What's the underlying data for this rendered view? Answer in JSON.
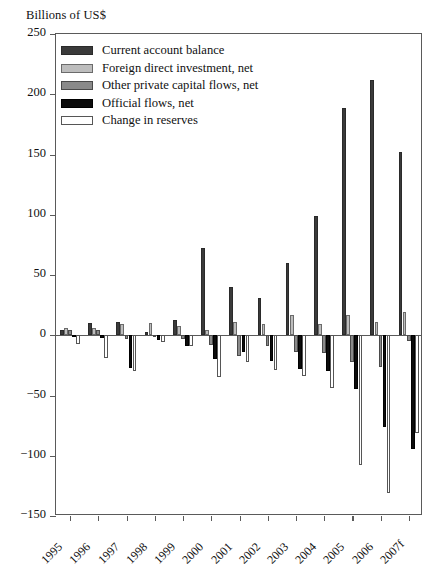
{
  "axis_label": "Billions of US$",
  "legend": {
    "items": [
      {
        "label": "Current account balance",
        "color": "#3a3a3a",
        "key": "current-account-balance"
      },
      {
        "label": "Foreign direct investment, net",
        "color": "#bdbdbd",
        "key": "foreign-direct-investment-net"
      },
      {
        "label": "Other private capital flows, net",
        "color": "#8a8a8a",
        "key": "other-private-capital-flows-net"
      },
      {
        "label": "Official flows, net",
        "color": "#0c0c0c",
        "key": "official-flows-net"
      },
      {
        "label": "Change in reserves",
        "color": "#ffffff",
        "key": "change-in-reserves"
      }
    ]
  },
  "chart_data": {
    "type": "bar",
    "title": "",
    "subtitle": "",
    "xlabel": "",
    "ylabel": "Billions of US$",
    "ylim": [
      -150,
      250
    ],
    "yticks": [
      250,
      200,
      150,
      100,
      50,
      0,
      -50,
      -100,
      -150
    ],
    "ytick_labels": [
      "250",
      "200",
      "150",
      "100",
      "50",
      "0",
      "−50",
      "−100",
      "−150"
    ],
    "grid": false,
    "legend_position": "top-left",
    "categories": [
      "1995",
      "1996",
      "1997",
      "1998",
      "1999",
      "2000",
      "2001",
      "2002",
      "2003",
      "2004",
      "2005",
      "2006",
      "2007f"
    ],
    "series": [
      {
        "name": "Current account balance",
        "color": "#3a3a3a",
        "values": [
          4,
          10,
          11,
          3,
          13,
          72,
          40,
          31,
          60,
          99,
          189,
          212,
          152
        ]
      },
      {
        "name": "Foreign direct investment, net",
        "color": "#bdbdbd",
        "values": [
          6,
          6,
          9,
          10,
          8,
          4,
          11,
          9,
          17,
          9,
          17,
          11,
          19
        ]
      },
      {
        "name": "Other private capital flows, net",
        "color": "#8a8a8a",
        "values": [
          4,
          4,
          -3,
          -1,
          -3,
          -8,
          -17,
          -9,
          -14,
          -15,
          -22,
          -26,
          -5
        ]
      },
      {
        "name": "Official flows, net",
        "color": "#0c0c0c",
        "values": [
          -1,
          -2,
          -27,
          -4,
          -9,
          -20,
          -14,
          -21,
          -28,
          -30,
          -45,
          -76,
          -94
        ]
      },
      {
        "name": "Change in reserves",
        "color": "#ffffff",
        "values": [
          -7,
          -19,
          -30,
          -6,
          -9,
          -35,
          -22,
          -29,
          -34,
          -44,
          -108,
          -131,
          -81
        ]
      }
    ]
  }
}
